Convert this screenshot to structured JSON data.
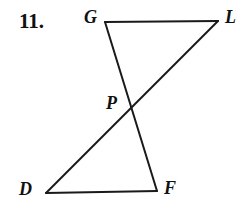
{
  "figure": {
    "problem_number": "11.",
    "background_color": "#ffffff",
    "stroke_color": "#1a1a1a",
    "stroke_width": 2,
    "label_color": "#111111",
    "description_type": "bowtie-hourglass-triangles",
    "points": {
      "G": {
        "label": "G",
        "x": 105,
        "y": 22
      },
      "L": {
        "label": "L",
        "x": 218,
        "y": 21
      },
      "P": {
        "label": "P",
        "x": 131,
        "y": 109
      },
      "D": {
        "label": "D",
        "x": 46,
        "y": 193
      },
      "F": {
        "label": "F",
        "x": 157,
        "y": 191
      }
    },
    "segments": [
      {
        "name": "segment-GL",
        "from": "G",
        "to": "L",
        "x1": 105,
        "y1": 22,
        "x2": 218,
        "y2": 21
      },
      {
        "name": "segment-GF",
        "from": "G",
        "to": "F",
        "x1": 105,
        "y1": 22,
        "x2": 157,
        "y2": 191
      },
      {
        "name": "segment-DL",
        "from": "D",
        "to": "L",
        "x1": 46,
        "y1": 193,
        "x2": 218,
        "y2": 21
      },
      {
        "name": "segment-DF",
        "from": "D",
        "to": "F",
        "x1": 46,
        "y1": 193,
        "x2": 157,
        "y2": 191
      }
    ]
  }
}
